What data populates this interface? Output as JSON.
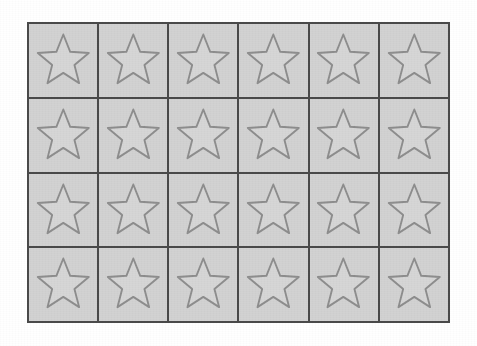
{
  "page": {
    "background_color": "#ffffff"
  },
  "grid": {
    "name": "star-grid",
    "columns": 6,
    "rows": 4,
    "total_cells": 24,
    "line_color": "#4a4a4a",
    "line_width_px": 2,
    "cell_background_color": "#d2d2d2",
    "x_px": 27,
    "y_px": 22,
    "width_px": 423,
    "height_px": 301,
    "cell_width_px": 69,
    "cell_height_px": 74
  },
  "icon": {
    "name": "star-icon",
    "shape": "five-pointed-star",
    "fill_color": "#d6d6d6",
    "stroke_color": "#8e8e8e",
    "stroke_width": 3.2,
    "points": "50,6 61.8,35.5 93.5,37.5 69,58.2 77,89 50,71.5 23,89 31,58.2 6.5,37.5 38.2,35.5"
  },
  "cells": [
    {
      "row": 1,
      "col": 1,
      "icon": "star-icon"
    },
    {
      "row": 1,
      "col": 2,
      "icon": "star-icon"
    },
    {
      "row": 1,
      "col": 3,
      "icon": "star-icon"
    },
    {
      "row": 1,
      "col": 4,
      "icon": "star-icon"
    },
    {
      "row": 1,
      "col": 5,
      "icon": "star-icon"
    },
    {
      "row": 1,
      "col": 6,
      "icon": "star-icon"
    },
    {
      "row": 2,
      "col": 1,
      "icon": "star-icon"
    },
    {
      "row": 2,
      "col": 2,
      "icon": "star-icon"
    },
    {
      "row": 2,
      "col": 3,
      "icon": "star-icon"
    },
    {
      "row": 2,
      "col": 4,
      "icon": "star-icon"
    },
    {
      "row": 2,
      "col": 5,
      "icon": "star-icon"
    },
    {
      "row": 2,
      "col": 6,
      "icon": "star-icon"
    },
    {
      "row": 3,
      "col": 1,
      "icon": "star-icon"
    },
    {
      "row": 3,
      "col": 2,
      "icon": "star-icon"
    },
    {
      "row": 3,
      "col": 3,
      "icon": "star-icon"
    },
    {
      "row": 3,
      "col": 4,
      "icon": "star-icon"
    },
    {
      "row": 3,
      "col": 5,
      "icon": "star-icon"
    },
    {
      "row": 3,
      "col": 6,
      "icon": "star-icon"
    },
    {
      "row": 4,
      "col": 1,
      "icon": "star-icon"
    },
    {
      "row": 4,
      "col": 2,
      "icon": "star-icon"
    },
    {
      "row": 4,
      "col": 3,
      "icon": "star-icon"
    },
    {
      "row": 4,
      "col": 4,
      "icon": "star-icon"
    },
    {
      "row": 4,
      "col": 5,
      "icon": "star-icon"
    },
    {
      "row": 4,
      "col": 6,
      "icon": "star-icon"
    }
  ]
}
